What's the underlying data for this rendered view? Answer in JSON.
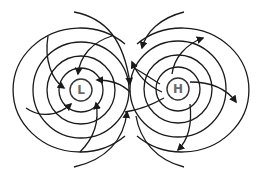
{
  "diagram": {
    "colors": {
      "line": "#1a1a1a",
      "label": "#6a6a6a",
      "background": "#ffffff"
    },
    "nodes": [
      {
        "id": "low",
        "label": "L",
        "cx": 81,
        "cy": 90,
        "r": 11
      },
      {
        "id": "high",
        "label": "H",
        "cx": 178,
        "cy": 89,
        "r": 11
      }
    ],
    "isobars": {
      "low": [
        22,
        34,
        48,
        67
      ],
      "high": [
        22,
        34,
        48,
        67
      ]
    },
    "wind_arrows": {
      "low": "inward (converging)",
      "high": "outward (diverging)"
    }
  }
}
